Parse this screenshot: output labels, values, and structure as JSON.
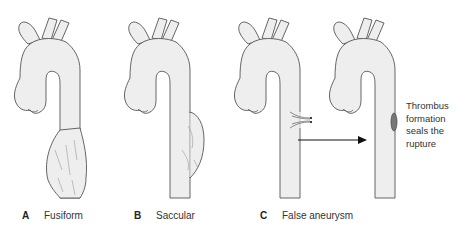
{
  "figure": {
    "panels": [
      {
        "letter": "A",
        "label": "Fusiform"
      },
      {
        "letter": "B",
        "label": "Saccular"
      },
      {
        "letter": "C",
        "label": "False aneurysm"
      }
    ],
    "annotation": {
      "line1": "Thrombus",
      "line2": "formation",
      "line3": "seals the",
      "line4": "rupture"
    },
    "colors": {
      "vessel_fill": "#eeeeee",
      "outline": "#555555",
      "thrombus": "#777777",
      "arrow": "#111111"
    }
  }
}
